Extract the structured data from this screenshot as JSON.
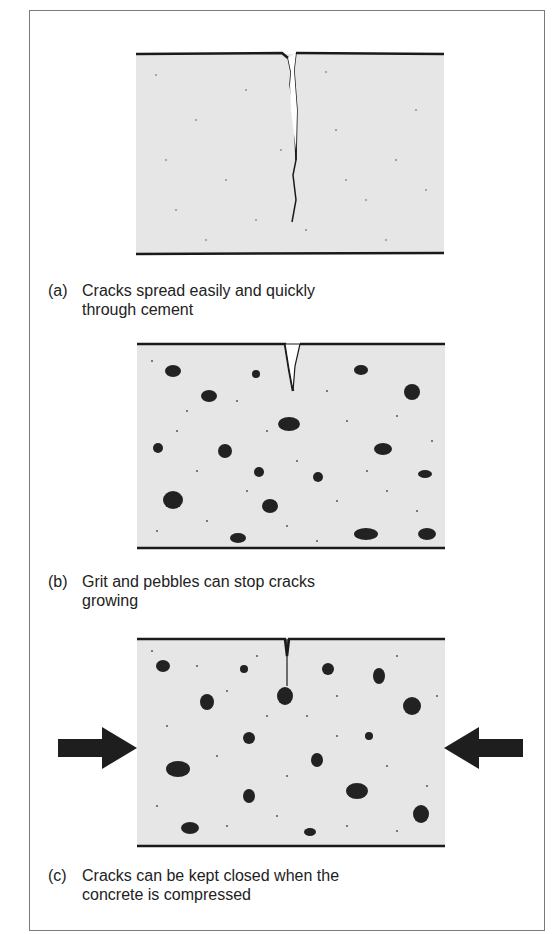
{
  "figure": {
    "panels": [
      {
        "id": "a",
        "tag": "(a)",
        "caption_line1": "Cracks spread easily and quickly",
        "caption_line2": "through cement",
        "material": "cement",
        "has_pebbles": false,
        "has_compression_arrows": false
      },
      {
        "id": "b",
        "tag": "(b)",
        "caption_line1": "Grit and pebbles can stop cracks",
        "caption_line2": "growing",
        "material": "concrete",
        "has_pebbles": true,
        "has_compression_arrows": false
      },
      {
        "id": "c",
        "tag": "(c)",
        "caption_line1": "Cracks can be kept closed when the",
        "caption_line2": "concrete is compressed",
        "material": "compressed concrete",
        "has_pebbles": true,
        "has_compression_arrows": true
      }
    ],
    "colors": {
      "fill": "#e6e6e6",
      "edge": "#1a1a1a",
      "pebble": "#222222",
      "arrow": "#1e1e1e",
      "frame": "#7a7a7a"
    }
  }
}
